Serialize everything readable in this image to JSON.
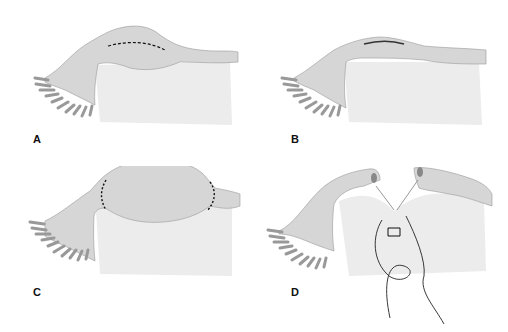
{
  "figure": {
    "panels": [
      {
        "label": "A",
        "description": "Oviduct with ampullary ectopic pregnancy bulge; dashed incision line along antimesenteric border"
      },
      {
        "label": "B",
        "description": "Linear salpingostomy incision opened over the bulge"
      },
      {
        "label": "C",
        "description": "Enlarged ectopic segment with dotted lines marking segmental resection on both sides"
      },
      {
        "label": "D",
        "description": "Segment removed; cut tubal ends approximated with suture through mesosalpinx"
      }
    ],
    "colors": {
      "background": "#ffffff",
      "tissue_fill": "#d6d6d6",
      "tissue_shadow": "#b4b4b4",
      "mesentery": "#ececec",
      "line": "#111111"
    }
  }
}
